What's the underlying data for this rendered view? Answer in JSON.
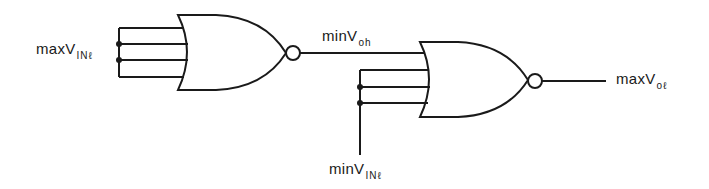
{
  "diagram": {
    "type": "logic-gate-circuit",
    "gates": [
      {
        "id": "nor-gate-1",
        "type": "NOR",
        "inputs": 4,
        "tied_inputs": true
      },
      {
        "id": "nor-gate-2",
        "type": "NOR",
        "inputs": 4,
        "tied_inputs": 3
      }
    ],
    "labels": {
      "input_1": {
        "main": "maxV",
        "sub": "INℓ"
      },
      "intermediate": {
        "main": "minV",
        "sub": "oh"
      },
      "input_2": {
        "main": "minV",
        "sub": "INℓ"
      },
      "output": {
        "main": "maxV",
        "sub": "oℓ"
      }
    },
    "colors": {
      "line": "#1a1a1a",
      "background": "#ffffff"
    }
  }
}
